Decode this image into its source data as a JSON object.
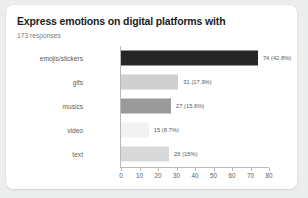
{
  "chart_data": {
    "type": "bar",
    "orientation": "horizontal",
    "title": "Express emotions on digital platforms with",
    "subtitle": "173 responses",
    "categories": [
      "emojis/stickers",
      "gifs",
      "musics",
      "video",
      "text"
    ],
    "values": [
      74,
      31,
      27,
      15,
      26
    ],
    "percentages": [
      "42.8%",
      "17.9%",
      "15.6%",
      "8.7%",
      "15%"
    ],
    "value_labels": [
      "74 (42.8%)",
      "31 (17.9%)",
      "27 (15.6%)",
      "15 (8.7%)",
      "26 (15%)"
    ],
    "bar_colors": [
      "#262626",
      "#cfcfcf",
      "#9a9a9a",
      "#f2f2f2",
      "#d9d9d9"
    ],
    "xlabel": "",
    "ylabel": "",
    "xlim": [
      0,
      80
    ],
    "xticks": [
      0,
      10,
      20,
      30,
      40,
      50,
      60,
      70,
      80
    ],
    "xtick_labels": [
      "0",
      "10",
      "20",
      "30",
      "40",
      "50",
      "60",
      "70",
      "80"
    ],
    "grid": false,
    "legend": false
  },
  "card": {
    "background": "#ffffff",
    "page_background": "#eceded"
  }
}
